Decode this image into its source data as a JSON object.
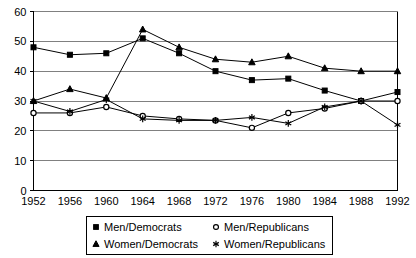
{
  "chart_data": {
    "type": "line",
    "title": "",
    "xlabel": "",
    "ylabel": "",
    "categories": [
      "1952",
      "1956",
      "1960",
      "1964",
      "1968",
      "1972",
      "1976",
      "1980",
      "1984",
      "1988",
      "1992"
    ],
    "ylim": [
      0,
      60
    ],
    "ytick_labels": [
      "0",
      "10",
      "20",
      "30",
      "40",
      "50",
      "60"
    ],
    "ytick_values": [
      0,
      10,
      20,
      30,
      40,
      50,
      60
    ],
    "grid": true,
    "legend_position": "bottom",
    "series": [
      {
        "name": "Men/Democrats",
        "marker": "square",
        "values": [
          48,
          45.5,
          46,
          51,
          46,
          40,
          37,
          37.5,
          33.5,
          30,
          33
        ]
      },
      {
        "name": "Men/Republicans",
        "marker": "circle",
        "values": [
          26,
          26,
          28,
          25,
          24,
          23.5,
          21,
          26,
          27.5,
          30,
          30
        ]
      },
      {
        "name": "Women/Democrats",
        "marker": "triangle",
        "values": [
          30,
          34,
          31,
          54,
          48,
          44,
          43,
          45,
          41,
          40,
          40
        ]
      },
      {
        "name": "Women/Republicans",
        "marker": "star",
        "values": [
          30,
          26.5,
          30.5,
          24,
          23.5,
          23.5,
          24.5,
          22.5,
          28,
          30,
          22
        ]
      }
    ]
  },
  "legend": {
    "items": [
      {
        "label": "Men/Democrats",
        "marker": "square"
      },
      {
        "label": "Men/Republicans",
        "marker": "circle"
      },
      {
        "label": "Women/Democrats",
        "marker": "triangle"
      },
      {
        "label": "Women/Republicans",
        "marker": "star"
      }
    ]
  }
}
